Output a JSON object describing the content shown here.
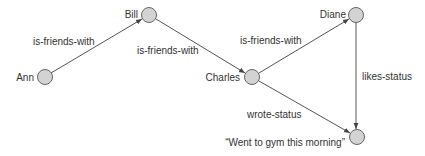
{
  "diagram": {
    "type": "directed-graph",
    "title": "",
    "colors": {
      "background": "#ffffff",
      "node_fill": "#d3d3d3",
      "node_stroke": "#666666",
      "edge": "#555555",
      "text": "#333333"
    },
    "nodes": [
      {
        "id": "ann",
        "label": "Ann",
        "cx": 45,
        "cy": 77
      },
      {
        "id": "bill",
        "label": "Bill",
        "cx": 149,
        "cy": 15
      },
      {
        "id": "charles",
        "label": "Charles",
        "cx": 252,
        "cy": 77
      },
      {
        "id": "diane",
        "label": "Diane",
        "cx": 356,
        "cy": 15
      },
      {
        "id": "status",
        "label": "“Went to gym this morning”",
        "cx": 357,
        "cy": 137
      }
    ],
    "edges": [
      {
        "from": "ann",
        "to": "bill",
        "label": "is-friends-with"
      },
      {
        "from": "bill",
        "to": "charles",
        "label": "is-friends-with"
      },
      {
        "from": "charles",
        "to": "diane",
        "label": "is-friends-with"
      },
      {
        "from": "charles",
        "to": "status",
        "label": "wrote-status"
      },
      {
        "from": "diane",
        "to": "status",
        "label": "likes-status"
      }
    ]
  }
}
